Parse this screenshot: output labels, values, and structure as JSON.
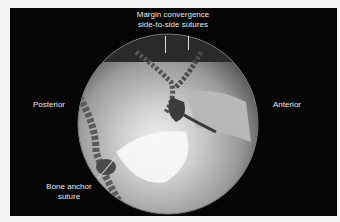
{
  "figure": {
    "type": "arthroscopic-photograph",
    "labels": {
      "top_line1": "Margin convergence",
      "top_line2": "side-to-side sutures",
      "left": "Posterior",
      "right": "Anterior",
      "bottom_line1": "Bone anchor",
      "bottom_line2": "suture"
    },
    "colors": {
      "background": "#f4f4f4",
      "frame": "#050505",
      "label_text": "#e8e8e8"
    }
  }
}
